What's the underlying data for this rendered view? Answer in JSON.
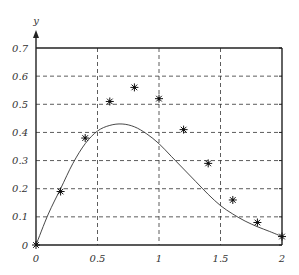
{
  "chart_data": {
    "type": "scatter",
    "title": "",
    "xlabel": "",
    "ylabel": "y",
    "xlim": [
      0,
      2
    ],
    "ylim": [
      0,
      0.7
    ],
    "grid": true,
    "x_ticks": [
      0,
      0.5,
      1,
      1.5,
      2
    ],
    "x_tick_labels": [
      "0",
      "0.5",
      "1",
      "1.5",
      "2"
    ],
    "y_ticks": [
      0,
      0.1,
      0.2,
      0.3,
      0.4,
      0.5,
      0.6,
      0.7
    ],
    "y_tick_labels": [
      "0",
      "0.1",
      "0.2",
      "0.3",
      "0.4",
      "0.5",
      "0.6",
      "0.7"
    ],
    "series": [
      {
        "name": "data points",
        "type": "scatter",
        "marker": "asterisk",
        "x": [
          0,
          0.2,
          0.4,
          0.6,
          0.8,
          1.0,
          1.2,
          1.4,
          1.6,
          1.8,
          2.0
        ],
        "y": [
          0,
          0.19,
          0.38,
          0.51,
          0.56,
          0.52,
          0.41,
          0.29,
          0.16,
          0.08,
          0.03
        ]
      },
      {
        "name": "fitted curve",
        "type": "line",
        "x": [
          0,
          0.1,
          0.2,
          0.3,
          0.4,
          0.5,
          0.6,
          0.7,
          0.8,
          0.9,
          1.0,
          1.1,
          1.2,
          1.3,
          1.4,
          1.5,
          1.6,
          1.7,
          1.8,
          1.9,
          2.0
        ],
        "y": [
          0,
          0.11,
          0.2,
          0.29,
          0.36,
          0.405,
          0.425,
          0.43,
          0.42,
          0.395,
          0.36,
          0.315,
          0.27,
          0.225,
          0.18,
          0.14,
          0.11,
          0.085,
          0.065,
          0.048,
          0.03
        ]
      }
    ]
  }
}
